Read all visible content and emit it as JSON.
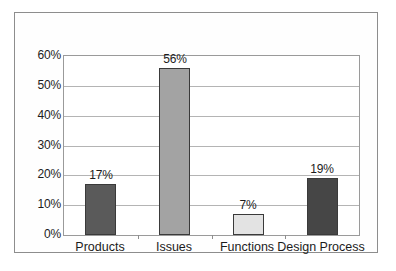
{
  "chart_data": {
    "type": "bar",
    "title": "",
    "subtitle": "",
    "xlabel": "",
    "ylabel": "",
    "categories": [
      "Products",
      "Issues",
      "Functions",
      "Design Process"
    ],
    "values": [
      17,
      56,
      7,
      19
    ],
    "value_labels": [
      "17%",
      "56%",
      "7%",
      "19%"
    ],
    "ylim": [
      0,
      60
    ],
    "ytick_labels": [
      "0%",
      "10%",
      "20%",
      "30%",
      "40%",
      "50%",
      "60%"
    ],
    "yticks": [
      0,
      10,
      20,
      30,
      40,
      50,
      60
    ],
    "grid": true,
    "legend": false,
    "bar_colors": [
      "#5a5a5a",
      "#a3a3a3",
      "#e3e3e3",
      "#464646"
    ],
    "bar_border_color": "#3a3a3a",
    "gridline_color": "#b4b4b4",
    "axis_color": "#9a9a9a",
    "frame_color": "#8d8d8d",
    "background_color": "#ffffff",
    "text_color": "#1c1c1c"
  }
}
